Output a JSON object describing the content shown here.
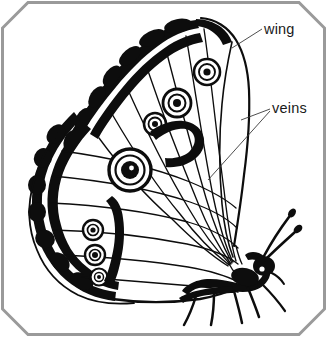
{
  "figure": {
    "view": "lateral underside view",
    "background_color": "#ffffff",
    "ink_color": "#0d0d0d",
    "frame": {
      "style": "chamfered-corner rectangle",
      "color": "#9a9a9a",
      "stroke_width": 3,
      "corners_chamfered": [
        "top-left",
        "top-right",
        "bottom-left",
        "bottom-right"
      ]
    },
    "labels": [
      {
        "id": "wing",
        "text": "wing",
        "x": 264,
        "y": 33,
        "leader_color": "#3a3a3a",
        "leaders": 1
      },
      {
        "id": "veins",
        "text": "veins",
        "x": 272,
        "y": 111,
        "leader_color": "#3a3a3a",
        "leaders": 2
      }
    ],
    "features": {
      "eyespot_count": 8,
      "antennae_count": 2,
      "legs_count": 4,
      "description": "Side view of a butterfly with folded wings showing dark marginal bands and concentric ringed eyespots, radiating veins, clubbed antennae and legs."
    }
  }
}
